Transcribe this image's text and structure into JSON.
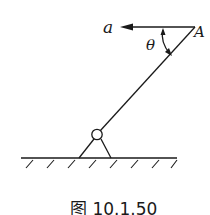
{
  "diagram": {
    "labels": {
      "acceleration": "a",
      "point": "A",
      "angle": "θ"
    },
    "caption": "图 10.1.50",
    "colors": {
      "stroke": "#1a1a1a",
      "background": "#ffffff"
    },
    "elements": [
      "horizontal acceleration arrow pointing left from A",
      "inclined rod from pinned support to point A",
      "curved angle arrow between arrow and rod",
      "pin support triangle on hatched ground"
    ]
  }
}
